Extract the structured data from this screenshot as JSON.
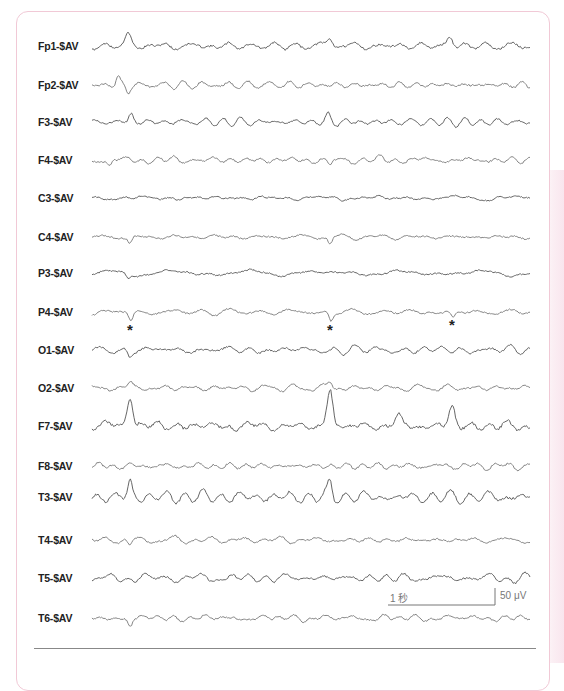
{
  "chart_data": {
    "type": "line",
    "title": "",
    "montage": "Average reference ($AV)",
    "channels": [
      {
        "name": "Fp1-$AV",
        "y": 46,
        "amp": 4.0,
        "seed": 11,
        "color": "#555555",
        "spikes": [
          {
            "x": 128,
            "h": -12,
            "w": 4
          },
          {
            "x": 330,
            "h": -9,
            "w": 4
          },
          {
            "x": 450,
            "h": -9,
            "w": 4
          }
        ]
      },
      {
        "name": "Fp2-$AV",
        "y": 85,
        "amp": 3.5,
        "seed": 23,
        "color": "#777777",
        "spikes": [
          {
            "x": 118,
            "h": -7,
            "w": 3
          },
          {
            "x": 128,
            "h": 6,
            "w": 3
          }
        ]
      },
      {
        "name": "F3-$AV",
        "y": 122,
        "amp": 3.0,
        "seed": 37,
        "color": "#555555",
        "spikes": [
          {
            "x": 131,
            "h": -8,
            "w": 3
          },
          {
            "x": 328,
            "h": -6,
            "w": 3
          }
        ]
      },
      {
        "name": "F4-$AV",
        "y": 160,
        "amp": 3.5,
        "seed": 41,
        "color": "#777777",
        "spikes": [
          {
            "x": 110,
            "h": 6,
            "w": 3
          },
          {
            "x": 330,
            "h": 5,
            "w": 3
          }
        ]
      },
      {
        "name": "C3-$AV",
        "y": 198,
        "amp": 2.5,
        "seed": 53,
        "color": "#555555",
        "spikes": []
      },
      {
        "name": "C4-$AV",
        "y": 237,
        "amp": 3.0,
        "seed": 67,
        "color": "#777777",
        "spikes": [
          {
            "x": 130,
            "h": 7,
            "w": 3
          },
          {
            "x": 330,
            "h": 6,
            "w": 3
          }
        ]
      },
      {
        "name": "P3-$AV",
        "y": 273,
        "amp": 2.8,
        "seed": 71,
        "color": "#555555",
        "spikes": [
          {
            "x": 128,
            "h": 5,
            "w": 3
          }
        ]
      },
      {
        "name": "P4-$AV",
        "y": 312,
        "amp": 2.8,
        "seed": 83,
        "color": "#777777",
        "spikes": [
          {
            "x": 131,
            "h": 9,
            "w": 3
          },
          {
            "x": 331,
            "h": 9,
            "w": 3
          },
          {
            "x": 453,
            "h": 7,
            "w": 3
          }
        ]
      },
      {
        "name": "O1-$AV",
        "y": 350,
        "amp": 3.5,
        "seed": 97,
        "color": "#555555",
        "spikes": [
          {
            "x": 130,
            "h": 6,
            "w": 3
          }
        ]
      },
      {
        "name": "O2-$AV",
        "y": 388,
        "amp": 3.0,
        "seed": 101,
        "color": "#777777",
        "spikes": [
          {
            "x": 130,
            "h": -6,
            "w": 3
          },
          {
            "x": 330,
            "h": -6,
            "w": 3
          }
        ]
      },
      {
        "name": "F7-$AV",
        "y": 426,
        "amp": 5.5,
        "seed": 113,
        "color": "#555555",
        "spikes": [
          {
            "x": 130,
            "h": -34,
            "w": 4
          },
          {
            "x": 330,
            "h": -36,
            "w": 4
          },
          {
            "x": 452,
            "h": -20,
            "w": 4
          },
          {
            "x": 398,
            "h": -10,
            "w": 4
          }
        ]
      },
      {
        "name": "F8-$AV",
        "y": 466,
        "amp": 3.5,
        "seed": 127,
        "color": "#777777",
        "spikes": []
      },
      {
        "name": "T3-$AV",
        "y": 497,
        "amp": 4.5,
        "seed": 131,
        "color": "#555555",
        "spikes": [
          {
            "x": 130,
            "h": -14,
            "w": 3
          },
          {
            "x": 330,
            "h": -14,
            "w": 3
          }
        ]
      },
      {
        "name": "T4-$AV",
        "y": 540,
        "amp": 3.0,
        "seed": 149,
        "color": "#777777",
        "spikes": [
          {
            "x": 130,
            "h": 6,
            "w": 3
          }
        ]
      },
      {
        "name": "T5-$AV",
        "y": 578,
        "amp": 3.5,
        "seed": 157,
        "color": "#555555",
        "spikes": []
      },
      {
        "name": "T6-$AV",
        "y": 618,
        "amp": 3.0,
        "seed": 163,
        "color": "#777777",
        "spikes": [
          {
            "x": 130,
            "h": 8,
            "w": 3
          }
        ]
      }
    ],
    "trace_x_range": [
      92,
      530
    ],
    "annotations": {
      "asterisks": [
        {
          "symbol": "*",
          "x": 127,
          "y": 322
        },
        {
          "symbol": "*",
          "x": 327,
          "y": 322
        },
        {
          "symbol": "*",
          "x": 449,
          "y": 317
        }
      ]
    },
    "calibration": {
      "time_label": "1 秒",
      "amplitude_label": "50 μV",
      "time_bar": {
        "x1": 388,
        "x2": 495,
        "y": 605
      },
      "amp_bar": {
        "x": 495,
        "y1": 588,
        "y2": 605
      }
    },
    "grid": false,
    "legend": "none",
    "xlabel": "",
    "ylabel": ""
  },
  "labels": {
    "ch0": "Fp1-$AV",
    "ch1": "Fp2-$AV",
    "ch2": "F3-$AV",
    "ch3": "F4-$AV",
    "ch4": "C3-$AV",
    "ch5": "C4-$AV",
    "ch6": "P3-$AV",
    "ch7": "P4-$AV",
    "ch8": "O1-$AV",
    "ch9": "O2-$AV",
    "ch10": "F7-$AV",
    "ch11": "F8-$AV",
    "ch12": "T3-$AV",
    "ch13": "T4-$AV",
    "ch14": "T5-$AV",
    "ch15": "T6-$AV"
  },
  "markers": {
    "asterisk": "*"
  },
  "calibration_text": {
    "time": "1 秒",
    "amplitude": "50 μV"
  },
  "colors": {
    "frame_border": "#f1c9d6",
    "trace_dark": "#555555",
    "trace_light": "#777777",
    "label": "#222222"
  }
}
